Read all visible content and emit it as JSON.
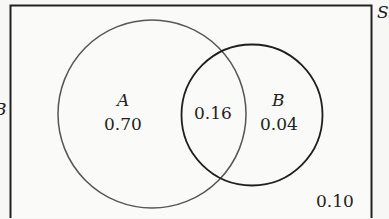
{
  "diagram": {
    "type": "venn",
    "universe_label": "S",
    "left_fragment_label": "B",
    "sets": [
      {
        "name": "A",
        "only_value": "0.70"
      },
      {
        "name": "B",
        "only_value": "0.04"
      }
    ],
    "intersection_value": "0.16",
    "outside_value": "0.10",
    "colors": {
      "background": "#f7f7f5",
      "universe_border": "#222222",
      "circle_a_stroke": "#555555",
      "circle_b_stroke": "#1e1e1e",
      "text": "#222222"
    }
  }
}
